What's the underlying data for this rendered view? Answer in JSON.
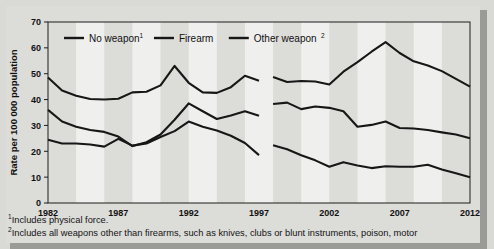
{
  "figure": {
    "accent_color": "#171717",
    "background_color": "#d9d9d6",
    "panel_color": "#dcdcd9"
  },
  "footnotes": {
    "one_marker": "1",
    "one_text": "Includes physical force.",
    "two_marker": "2",
    "two_text": "Includes all weapons other than firearms, such as knives, clubs or blunt instruments, poison, motor"
  },
  "legend": [
    {
      "label": "No weapon",
      "sup": "1"
    },
    {
      "label": "Firearm",
      "sup": ""
    },
    {
      "label": "Other weapon",
      "sup": "2"
    }
  ],
  "chart_data": {
    "type": "line",
    "title": "",
    "xlabel": "",
    "ylabel": "Rate per 100 000 population",
    "ylim": [
      0,
      70
    ],
    "xlim": [
      1982,
      2012
    ],
    "yticks": [
      0,
      10,
      20,
      30,
      40,
      50,
      60,
      70
    ],
    "xticks": [
      1982,
      1987,
      1992,
      1997,
      2002,
      2007,
      2012
    ],
    "grid": false,
    "legend_position": "top-left-inside",
    "band_shading": true,
    "break_between": [
      1997,
      1998
    ],
    "x": [
      1982,
      1983,
      1984,
      1985,
      1986,
      1987,
      1988,
      1989,
      1990,
      1991,
      1992,
      1993,
      1994,
      1995,
      1996,
      1997,
      1998,
      1999,
      2000,
      2001,
      2002,
      2003,
      2004,
      2005,
      2006,
      2007,
      2008,
      2009,
      2010,
      2011,
      2012
    ],
    "series": [
      {
        "name": "Other weapon",
        "sup": "2",
        "values": [
          48.5,
          43.5,
          41.5,
          40.2,
          40.0,
          40.3,
          42.8,
          43.0,
          45.5,
          53.0,
          46.5,
          42.8,
          42.6,
          44.8,
          49.2,
          47.3,
          48.7,
          46.8,
          47.2,
          47.0,
          45.8,
          50.8,
          54.5,
          58.5,
          62.2,
          58.0,
          54.8,
          53.2,
          51.0,
          48.0,
          45.0
        ]
      },
      {
        "name": "Firearm",
        "sup": "",
        "values": [
          36.0,
          31.5,
          29.5,
          28.2,
          27.5,
          25.7,
          22.0,
          23.5,
          26.5,
          32.2,
          38.5,
          35.5,
          32.5,
          33.8,
          35.5,
          33.7,
          38.3,
          38.8,
          36.3,
          37.3,
          36.8,
          35.5,
          29.5,
          30.2,
          31.5,
          29.0,
          28.8,
          28.2,
          27.3,
          26.5,
          25.0
        ]
      },
      {
        "name": "No weapon",
        "sup": "1",
        "values": [
          24.5,
          23.0,
          23.0,
          22.6,
          21.8,
          24.8,
          22.2,
          23.0,
          25.5,
          27.8,
          31.5,
          29.5,
          28.0,
          26.0,
          23.2,
          18.5,
          22.3,
          20.8,
          18.5,
          16.5,
          14.0,
          15.8,
          14.5,
          13.5,
          14.2,
          14.0,
          14.0,
          14.8,
          13.0,
          11.5,
          10.0
        ]
      }
    ]
  }
}
